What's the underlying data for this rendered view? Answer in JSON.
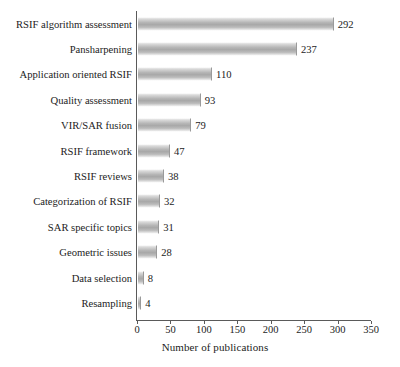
{
  "chart_data": {
    "type": "bar",
    "orientation": "horizontal",
    "title": "",
    "xlabel": "Number of publications",
    "ylabel": "",
    "xlim": [
      0,
      350
    ],
    "xticks": [
      0,
      50,
      100,
      150,
      200,
      250,
      300,
      350
    ],
    "grid": false,
    "legend": null,
    "bar_color": "#b0b0b0",
    "axis_color": "#5a5a5a",
    "text_color": "#1c1c1c",
    "categories": [
      "RSIF algorithm assessment",
      "Pansharpening",
      "Application oriented RSIF",
      "Quality assessment",
      "VIR/SAR fusion",
      "RSIF framework",
      "RSIF reviews",
      "Categorization of RSIF",
      "SAR specific topics",
      "Geometric issues",
      "Data selection",
      "Resampling"
    ],
    "values": [
      292,
      237,
      110,
      93,
      79,
      47,
      38,
      32,
      31,
      28,
      8,
      4
    ],
    "data_labels": [
      "292",
      "237",
      "110",
      "93",
      "79",
      "47",
      "38",
      "32",
      "31",
      "28",
      "8",
      "4"
    ]
  }
}
